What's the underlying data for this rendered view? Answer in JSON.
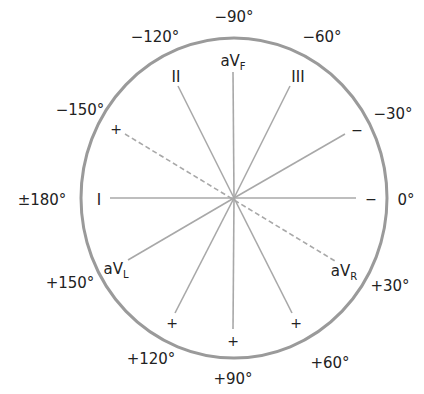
{
  "diagram": {
    "colors": {
      "circle": "#9a9a9a",
      "axis_line": "#a8a8a8",
      "text": "#222222",
      "background": "#ffffff"
    },
    "degree_labels": [
      {
        "id": "deg-minus90",
        "text": "−90°"
      },
      {
        "id": "deg-minus60",
        "text": "−60°"
      },
      {
        "id": "deg-minus30",
        "text": "−30°"
      },
      {
        "id": "deg-0",
        "text": "0°"
      },
      {
        "id": "deg-plus30",
        "text": "+30°"
      },
      {
        "id": "deg-plus60",
        "text": "+60°"
      },
      {
        "id": "deg-plus90",
        "text": "+90°"
      },
      {
        "id": "deg-plus120",
        "text": "+120°"
      },
      {
        "id": "deg-plus150",
        "text": "+150°"
      },
      {
        "id": "deg-180",
        "text": "±180°"
      },
      {
        "id": "deg-minus150",
        "text": "−150°"
      },
      {
        "id": "deg-minus120",
        "text": "−120°"
      }
    ],
    "leads": {
      "I": {
        "name": "I",
        "pole_plus_end": "0°",
        "marker_at_180": "I",
        "marker_at_0": "−"
      },
      "II": {
        "name": "II",
        "marker_at_minus120": "II",
        "marker_at_60": "+"
      },
      "III": {
        "name": "III",
        "marker_at_minus60": "III",
        "marker_at_120": "+"
      },
      "aVF": {
        "name": "aV",
        "subscript": "F",
        "marker_at_90": "+"
      },
      "aVL": {
        "name": "aV",
        "subscript": "L",
        "marker_at_minus30": "−"
      },
      "aVR": {
        "name": "aV",
        "subscript": "R",
        "marker_at_minus150": "+",
        "dashed": true
      }
    },
    "signs": {
      "plus": "+",
      "minus": "−"
    }
  }
}
